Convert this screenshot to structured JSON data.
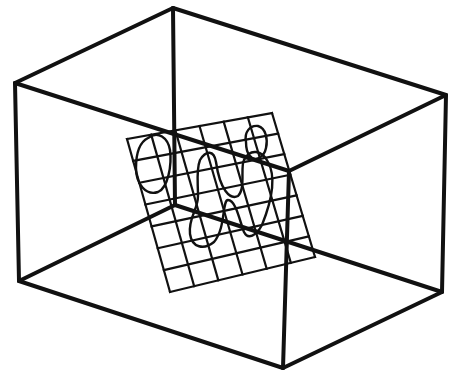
{
  "diagram": {
    "colors": {
      "line": "#111111",
      "background": "#ffffff"
    },
    "box": {
      "vertices": {
        "top_back": [
          173,
          8
        ],
        "top_left": [
          15,
          83
        ],
        "top_right": [
          446,
          95
        ],
        "top_front": [
          289,
          171
        ],
        "bottom_back": [
          175,
          205
        ],
        "bottom_left": [
          19,
          281
        ],
        "bottom_right": [
          442,
          292
        ],
        "bottom_front": [
          283,
          368
        ]
      }
    },
    "grid_plane": {
      "corners": {
        "top_left": [
          127,
          139
        ],
        "top_right": [
          272,
          113
        ],
        "bottom_right": [
          315,
          257
        ],
        "bottom_left": [
          170,
          292
        ]
      },
      "columns": 6,
      "rows": 7
    }
  }
}
